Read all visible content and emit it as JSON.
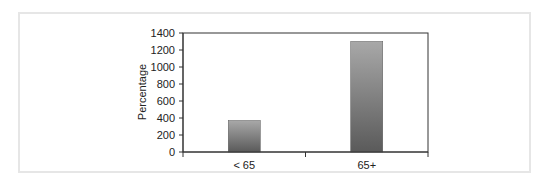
{
  "chart_data": {
    "type": "bar",
    "title": "",
    "xlabel": "",
    "ylabel": "Percentage",
    "categories": [
      "< 65",
      "65+"
    ],
    "values": [
      370,
      1300
    ],
    "ylim": [
      0,
      1400
    ],
    "yticks": [
      0,
      200,
      400,
      600,
      800,
      1000,
      1200,
      1400
    ],
    "grid": false,
    "legend": null,
    "bar_color": "#7a7a7a"
  }
}
